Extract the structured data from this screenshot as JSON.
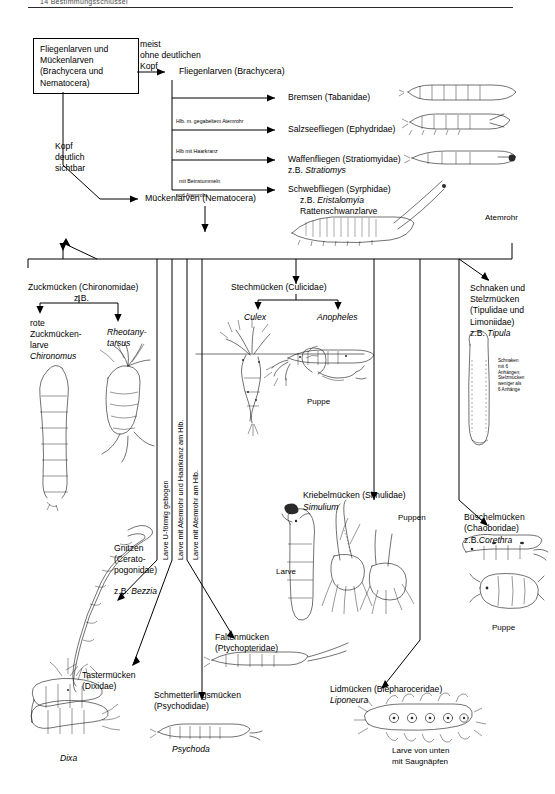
{
  "page": {
    "header_rule": true,
    "header_text": "14  Bestimmungsschlüssel"
  },
  "root": {
    "label": "Fliegenlarven und\nMückenlarven\n(Brachycera und\nNematocera)"
  },
  "branch_conditions": {
    "no_head": "meist\nohne deutlichen\nKopf",
    "head_visible": "Kopf\ndeutlich\nsichtbar"
  },
  "brachycera": {
    "title": "Fliegenlarven (Brachycera)",
    "children": [
      {
        "label": "Bremsen (Tabanidae)",
        "condition": ""
      },
      {
        "label": "Salzseefliegen (Ephydridae)",
        "condition": "Hlb. m. gegabeltem Atemrohr"
      },
      {
        "label": "Waffenfliegen (Stratiomyidae)",
        "label2": "z.B. ",
        "genus": "Stratiomys",
        "condition": "Hlb mit Haarkranz"
      },
      {
        "label": "Schwebfliegen (Syrphidae)",
        "label2": "z.B. ",
        "genus": "Eristalomyia",
        "label3": "Rattenschwanzlarve",
        "condition": "mit Beinstummeln",
        "condition2": "und Atemrohr"
      }
    ],
    "annotation_atemrohr": "Atemrohr"
  },
  "nematocera": {
    "title": "Mückenlarven (Nematocera)",
    "vertical_conditions": [
      "Larve U-förmig gebogen",
      "Larve mit Atemrohr und Haarkranz am Hlb.",
      "Larve mit Atemrohr am Hlb."
    ],
    "groups": [
      {
        "name": "chironomidae",
        "label": "Zuckmücken (Chironomidae)",
        "label_zb": "z.B.",
        "children": [
          {
            "label": "rote\nZuckmücken-\nlarve",
            "genus": "Chironomus"
          },
          {
            "genus": "Rheotany-\ntarsus"
          }
        ]
      },
      {
        "name": "culicidae",
        "label": "Stechmücken (Culicidae)",
        "children": [
          {
            "genus": "Culex"
          },
          {
            "genus": "Anopheles"
          }
        ],
        "annotation": "Puppe"
      },
      {
        "name": "tipulidae",
        "label": "Schnaken und\nStelzmücken\n(Tipulidae und\nLimoniidae)",
        "label_zb": "z.B. ",
        "genus": "Tipula",
        "note": "Schnaken\nmit 6\nAnhängen;\nStelzmücken\nweniger als\n6 Anhänge"
      },
      {
        "name": "ceratopogonidae",
        "label": "Gnitzen\n(Cerato-\npogonidae)",
        "label_zb": "z.B. ",
        "genus": "Bezzia"
      },
      {
        "name": "simuliidae",
        "label": "Kriebelmücken (Simulidae)",
        "genus": "Simulium",
        "annotations": [
          "Larve",
          "Puppen"
        ]
      },
      {
        "name": "chaoboridae",
        "label": "Büschelmücken\n(Chaoboridae)",
        "label_zb": "z.B.",
        "genus": "Corethra",
        "annotation": "Puppe"
      },
      {
        "name": "dixidae",
        "label": "Tastermücken\n(Dixidae)",
        "genus": "Dixa"
      },
      {
        "name": "psychodidae",
        "label": "Schmetterlingsmücken\n(Psychodidae)",
        "genus": "Psychoda"
      },
      {
        "name": "ptychopteridae",
        "label": "Faltenmücken\n(Ptychopteridae)"
      },
      {
        "name": "blephaceridae",
        "label": "Lidmücken (Blepharoceridae)",
        "genus": "Liponeura",
        "annotation": "Larve von unten\nmit Saugnäpfen"
      }
    ]
  }
}
